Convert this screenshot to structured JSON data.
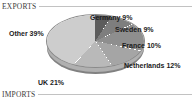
{
  "sections": {
    "exports": {
      "title": "EXPORTS"
    },
    "imports": {
      "title": "IMPORTS"
    }
  },
  "chart_data": {
    "type": "pie",
    "title": "EXPORTS",
    "xlabel": "",
    "ylabel": "",
    "categories": [
      "Germany",
      "Sweden",
      "France",
      "Netherlands",
      "UK",
      "Other"
    ],
    "values": [
      9,
      9,
      10,
      12,
      21,
      39
    ],
    "unit": "%",
    "labels": [
      "Germany 9%",
      "Sweden 9%",
      "France 10%",
      "Netherlands 12%",
      "UK 21%",
      "Other 39%"
    ],
    "slice_colors": [
      "#5c5c5c",
      "#7e7e7e",
      "#8e8e8e",
      "#a5a5a5",
      "#b9b9b9",
      "#cdcdcd"
    ],
    "legend": "none",
    "grid": false,
    "three_d": true,
    "start_angle_deg": 0,
    "direction": "clockwise"
  },
  "style": {
    "background": "#ffffff",
    "rule_color": "#c2c2c2",
    "header_text_color": "#3b3b3b",
    "label_text_color": "#1b1b1b",
    "pie_side_color": "#9d9d9d"
  }
}
